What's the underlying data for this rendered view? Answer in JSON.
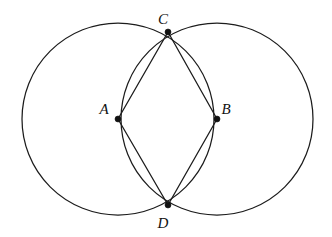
{
  "figure": {
    "background_color": "#ffffff",
    "stroke_color": "#1c1c1c",
    "label_color": "#111111",
    "width": 332,
    "height": 237
  },
  "points": {
    "A": {
      "label": "A",
      "x": 118,
      "y": 119,
      "label_x": 104,
      "label_y": 114
    },
    "B": {
      "label": "B",
      "x": 217,
      "y": 119,
      "label_x": 226,
      "label_y": 114
    },
    "C": {
      "label": "C",
      "x": 168,
      "y": 32,
      "label_x": 163,
      "label_y": 24
    },
    "D": {
      "label": "D",
      "x": 168,
      "y": 205,
      "label_x": 163,
      "label_y": 228
    }
  },
  "circles": [
    {
      "name": "circle-centered-at-A",
      "cx": 118,
      "cy": 119,
      "r": 96
    },
    {
      "name": "circle-centered-at-B",
      "cx": 217,
      "cy": 119,
      "r": 96
    }
  ],
  "segments": [
    {
      "name": "segment-A-C",
      "from": "A",
      "to": "C",
      "x1": 118,
      "y1": 119,
      "x2": 168,
      "y2": 32
    },
    {
      "name": "segment-C-B",
      "from": "C",
      "to": "B",
      "x1": 168,
      "y1": 32,
      "x2": 217,
      "y2": 119
    },
    {
      "name": "segment-B-D",
      "from": "B",
      "to": "D",
      "x1": 217,
      "y1": 119,
      "x2": 168,
      "y2": 205
    },
    {
      "name": "segment-D-A",
      "from": "D",
      "to": "A",
      "x1": 168,
      "y1": 205,
      "x2": 118,
      "y2": 119
    }
  ],
  "dot_radius": 3
}
